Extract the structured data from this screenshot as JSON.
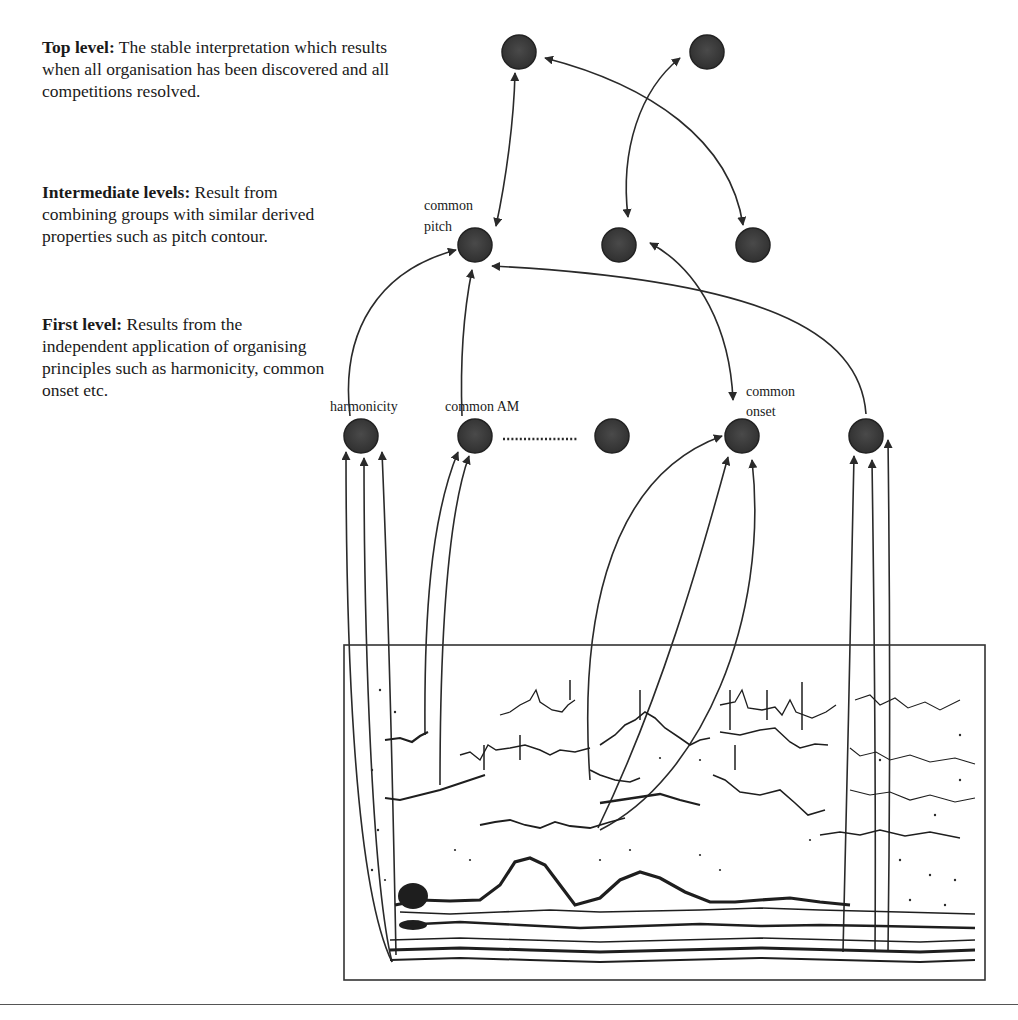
{
  "descriptions": {
    "top": {
      "heading": "Top level:",
      "text": " The stable interpretation which results when all organisation has been discovered and all competitions resolved."
    },
    "intermediate": {
      "heading": "Intermediate levels:",
      "text": " Result from combining groups with similar derived properties such as pitch contour."
    },
    "first": {
      "heading": "First level:",
      "text": " Results from the independent application of organising principles such as harmonicity, common onset etc."
    }
  },
  "node_labels": {
    "common_pitch_line1": "common",
    "common_pitch_line2": "pitch",
    "harmonicity": "harmonicity",
    "common_am": "common AM",
    "common_onset_line1": "common",
    "common_onset_line2": "onset"
  },
  "nodes": {
    "top": [
      {
        "id": "top-1",
        "x": 519,
        "y": 52
      },
      {
        "id": "top-2",
        "x": 707,
        "y": 52
      }
    ],
    "intermediate": [
      {
        "id": "common-pitch",
        "x": 475,
        "y": 245
      },
      {
        "id": "mid-2",
        "x": 619,
        "y": 245
      },
      {
        "id": "mid-3",
        "x": 753,
        "y": 245
      }
    ],
    "first": [
      {
        "id": "harmonicity",
        "x": 361,
        "y": 436
      },
      {
        "id": "common-am",
        "x": 475,
        "y": 436
      },
      {
        "id": "first-3",
        "x": 612,
        "y": 436
      },
      {
        "id": "common-onset",
        "x": 742,
        "y": 436
      },
      {
        "id": "first-5",
        "x": 866,
        "y": 436
      }
    ]
  },
  "colors": {
    "node_fill": "#3a3a3a",
    "line": "#2a2a2a",
    "background": "#ffffff"
  },
  "spectrogram": {
    "x": 344,
    "y": 645,
    "width": 641,
    "height": 335
  }
}
